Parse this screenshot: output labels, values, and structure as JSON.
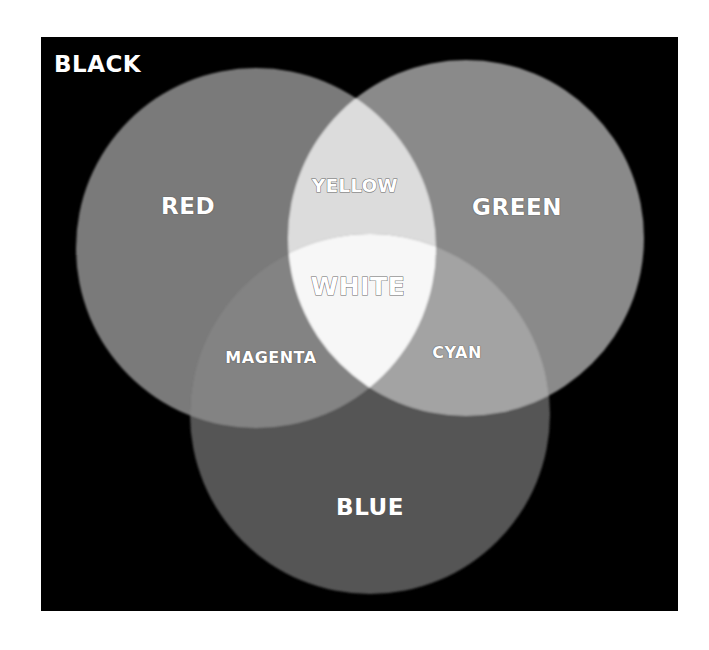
{
  "diagram": {
    "title_label": "BLACK",
    "background": {
      "x": 41,
      "y": 37,
      "width": 637,
      "height": 574,
      "color": "#000000"
    },
    "circles": [
      {
        "id": "red",
        "label": "RED",
        "cx": 256,
        "cy": 248,
        "r": 180,
        "color": "#7a7a7a"
      },
      {
        "id": "green",
        "label": "GREEN",
        "cx": 466,
        "cy": 238,
        "r": 178,
        "color": "#8a8a8a"
      },
      {
        "id": "blue",
        "label": "BLUE",
        "cx": 370,
        "cy": 414,
        "r": 180,
        "color": "#555555"
      }
    ],
    "overlaps": [
      {
        "id": "yellow",
        "label": "YELLOW",
        "sets": [
          "red",
          "green"
        ],
        "color": "#dcdcdc"
      },
      {
        "id": "magenta",
        "label": "MAGENTA",
        "sets": [
          "red",
          "blue"
        ],
        "color": "#838383"
      },
      {
        "id": "cyan",
        "label": "CYAN",
        "sets": [
          "green",
          "blue"
        ],
        "color": "#a3a3a3"
      },
      {
        "id": "white",
        "label": "WHITE",
        "sets": [
          "red",
          "green",
          "blue"
        ],
        "color": "#f7f7f7"
      }
    ],
    "labels": {
      "black": {
        "text": "BLACK",
        "x": 54,
        "y": 53,
        "size": 23
      },
      "red": {
        "text": "RED",
        "x": 188,
        "y": 206,
        "size": 23
      },
      "green": {
        "text": "GREEN",
        "x": 517,
        "y": 207,
        "size": 23
      },
      "yellow": {
        "text": "YELLOW",
        "x": 355,
        "y": 186,
        "size": 18
      },
      "white": {
        "text": "WHITE",
        "x": 358,
        "y": 286,
        "size": 25
      },
      "magenta": {
        "text": "MAGENTA",
        "x": 271,
        "y": 358,
        "size": 16
      },
      "cyan": {
        "text": "CYAN",
        "x": 457,
        "y": 353,
        "size": 16
      },
      "blue": {
        "text": "BLUE",
        "x": 370,
        "y": 507,
        "size": 23
      }
    }
  }
}
